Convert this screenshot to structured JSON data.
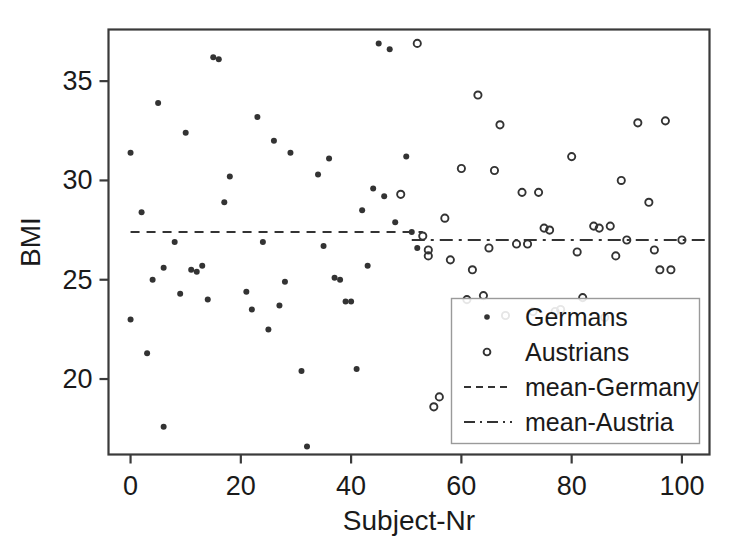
{
  "chart_data": {
    "type": "scatter",
    "title": "",
    "xlabel": "Subject-Nr",
    "ylabel": "BMI",
    "xlim": [
      -4,
      105
    ],
    "ylim": [
      16.2,
      37.6
    ],
    "xticks": [
      0,
      20,
      40,
      60,
      80,
      100
    ],
    "yticks": [
      20,
      25,
      30,
      35
    ],
    "grid": false,
    "legend_position": "lower right",
    "series": [
      {
        "name": "Germans",
        "marker": "filled-dot",
        "color": "#333333",
        "points": [
          [
            0,
            31.4
          ],
          [
            0,
            23.0
          ],
          [
            2,
            28.4
          ],
          [
            3,
            21.3
          ],
          [
            4,
            25.0
          ],
          [
            5,
            33.9
          ],
          [
            6,
            25.6
          ],
          [
            6,
            17.6
          ],
          [
            8,
            26.9
          ],
          [
            9,
            24.3
          ],
          [
            10,
            32.4
          ],
          [
            11,
            25.5
          ],
          [
            12,
            25.4
          ],
          [
            13,
            25.7
          ],
          [
            14,
            24.0
          ],
          [
            15,
            36.2
          ],
          [
            16,
            36.1
          ],
          [
            17,
            28.9
          ],
          [
            18,
            30.2
          ],
          [
            21,
            24.4
          ],
          [
            22,
            23.5
          ],
          [
            23,
            33.2
          ],
          [
            24,
            26.9
          ],
          [
            25,
            22.5
          ],
          [
            26,
            32.0
          ],
          [
            27,
            23.7
          ],
          [
            28,
            24.9
          ],
          [
            29,
            31.4
          ],
          [
            31,
            20.4
          ],
          [
            32,
            16.6
          ],
          [
            34,
            30.3
          ],
          [
            35,
            26.7
          ],
          [
            36,
            31.1
          ],
          [
            37,
            25.1
          ],
          [
            38,
            25.0
          ],
          [
            39,
            23.9
          ],
          [
            40,
            23.9
          ],
          [
            41,
            20.5
          ],
          [
            42,
            28.5
          ],
          [
            43,
            25.7
          ],
          [
            44,
            29.6
          ],
          [
            45,
            36.9
          ],
          [
            46,
            29.2
          ],
          [
            47,
            36.6
          ],
          [
            48,
            27.9
          ],
          [
            50,
            31.2
          ],
          [
            51,
            27.4
          ],
          [
            52,
            26.6
          ]
        ]
      },
      {
        "name": "Austrians",
        "marker": "open-circle",
        "color": "#333333",
        "points": [
          [
            49,
            29.3
          ],
          [
            52,
            36.9
          ],
          [
            53,
            27.2
          ],
          [
            54,
            26.5
          ],
          [
            54,
            26.2
          ],
          [
            55,
            18.6
          ],
          [
            56,
            19.1
          ],
          [
            57,
            28.1
          ],
          [
            58,
            26.0
          ],
          [
            60,
            30.6
          ],
          [
            61,
            24.0
          ],
          [
            62,
            25.5
          ],
          [
            63,
            34.3
          ],
          [
            64,
            24.2
          ],
          [
            65,
            26.6
          ],
          [
            66,
            30.5
          ],
          [
            67,
            32.8
          ],
          [
            68,
            23.2
          ],
          [
            70,
            26.8
          ],
          [
            71,
            29.4
          ],
          [
            72,
            26.8
          ],
          [
            73,
            23.4
          ],
          [
            74,
            29.4
          ],
          [
            75,
            27.6
          ],
          [
            76,
            27.5
          ],
          [
            77,
            23.4
          ],
          [
            78,
            23.5
          ],
          [
            80,
            31.2
          ],
          [
            81,
            26.4
          ],
          [
            82,
            24.1
          ],
          [
            84,
            27.7
          ],
          [
            85,
            27.6
          ],
          [
            86,
            23.1
          ],
          [
            87,
            27.7
          ],
          [
            88,
            26.2
          ],
          [
            89,
            30.0
          ],
          [
            90,
            27.0
          ],
          [
            92,
            32.9
          ],
          [
            94,
            28.9
          ],
          [
            95,
            26.5
          ],
          [
            96,
            25.5
          ],
          [
            97,
            33.0
          ],
          [
            98,
            25.5
          ],
          [
            100,
            27.0
          ]
        ]
      }
    ],
    "reference_lines": [
      {
        "name": "mean-Germany",
        "value": 27.4,
        "style": "dashed",
        "x_from": 0,
        "x_to": 53,
        "color": "#333333"
      },
      {
        "name": "mean-Austria",
        "value": 27.0,
        "style": "dashdot",
        "x_from": 51,
        "x_to": 105,
        "color": "#333333"
      }
    ],
    "legend_entries": [
      {
        "label": "Germans",
        "kind": "filled-dot"
      },
      {
        "label": "Austrians",
        "kind": "open-circle"
      },
      {
        "label": "mean-Germany",
        "kind": "dashed-line"
      },
      {
        "label": "mean-Austria",
        "kind": "dashdot-line"
      }
    ]
  },
  "axes": {
    "x_tick_labels": [
      "0",
      "20",
      "40",
      "60",
      "80",
      "100"
    ],
    "y_tick_labels": [
      "20",
      "25",
      "30",
      "35"
    ],
    "x_axis_title": "Subject-Nr",
    "y_axis_title": "BMI"
  },
  "colors": {
    "frame": "#3a3a3a",
    "marker": "#333333",
    "text": "#1a1a1a",
    "legend_border": "#9a9a9a",
    "background": "#ffffff"
  }
}
